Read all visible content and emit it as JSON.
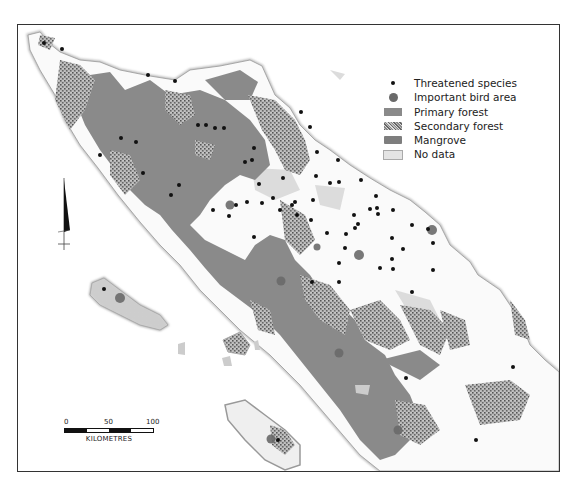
{
  "legend": {
    "items": [
      {
        "symbol": "dot",
        "label": "Threatened species",
        "color": "#111111"
      },
      {
        "symbol": "circle",
        "label": "Important bird area",
        "color": "#6a6a6a"
      },
      {
        "symbol": "swatch-solid",
        "label": "Primary forest",
        "color": "#8a8a8a"
      },
      {
        "symbol": "swatch-speckled",
        "label": "Secondary forest",
        "color": "#9a9a9a"
      },
      {
        "symbol": "swatch-solid-dark",
        "label": "Mangrove",
        "color": "#7e7e7e"
      },
      {
        "symbol": "swatch-light",
        "label": "No data",
        "color": "#dcdcdc"
      }
    ]
  },
  "scale_bar": {
    "ticks": [
      "0",
      "50",
      "100"
    ],
    "unit": "KILOMETRES"
  },
  "north_arrow": {
    "icon": "north-arrow-icon"
  },
  "colors": {
    "land": "#f4f4f4",
    "coast": "#bdbdbd",
    "primary_forest": "#8a8a8a",
    "secondary_forest": "#9c9c9c",
    "no_data": "#dcdcdc",
    "threatened_dot": "#111111",
    "bird_area": "#6a6a6a"
  },
  "threatened_species_points": [
    [
      44,
      43
    ],
    [
      62,
      49
    ],
    [
      148,
      75
    ],
    [
      175,
      83
    ],
    [
      224,
      129
    ],
    [
      198,
      125
    ],
    [
      206,
      127
    ],
    [
      214,
      128
    ],
    [
      121,
      138
    ],
    [
      179,
      185
    ],
    [
      143,
      173
    ],
    [
      252,
      160
    ],
    [
      301,
      114
    ],
    [
      310,
      129
    ],
    [
      245,
      162
    ],
    [
      259,
      167
    ],
    [
      247,
      206
    ],
    [
      213,
      210
    ],
    [
      236,
      215
    ],
    [
      262,
      203
    ],
    [
      295,
      203
    ],
    [
      295,
      213
    ],
    [
      338,
      159
    ],
    [
      316,
      176
    ],
    [
      283,
      177
    ],
    [
      315,
      152
    ],
    [
      341,
      181
    ],
    [
      358,
      224
    ],
    [
      346,
      235
    ],
    [
      339,
      263
    ],
    [
      354,
      215
    ],
    [
      307,
      151
    ],
    [
      339,
      194
    ],
    [
      361,
      180
    ],
    [
      330,
      180
    ],
    [
      376,
      195
    ],
    [
      378,
      208
    ],
    [
      377,
      214
    ],
    [
      407,
      211
    ],
    [
      355,
      228
    ],
    [
      327,
      236
    ],
    [
      297,
      181
    ],
    [
      288,
      208
    ],
    [
      345,
      248
    ],
    [
      273,
      198
    ],
    [
      370,
      208
    ],
    [
      392,
      211
    ],
    [
      412,
      225
    ],
    [
      413,
      241
    ],
    [
      422,
      268
    ],
    [
      412,
      290
    ],
    [
      423,
      213
    ],
    [
      391,
      237
    ],
    [
      404,
      248
    ],
    [
      368,
      274
    ],
    [
      349,
      293
    ],
    [
      312,
      282
    ],
    [
      294,
      232
    ],
    [
      290,
      236
    ],
    [
      433,
      239
    ],
    [
      460,
      277
    ],
    [
      513,
      367
    ],
    [
      406,
      378
    ],
    [
      105,
      290
    ],
    [
      280,
      241
    ],
    [
      136,
      142
    ],
    [
      171,
      195
    ],
    [
      100,
      155
    ],
    [
      259,
      184
    ],
    [
      301,
      158
    ],
    [
      313,
      201
    ],
    [
      254,
      237
    ]
  ],
  "important_bird_areas": [
    [
      230,
      205
    ],
    [
      359,
      255
    ],
    [
      432,
      230
    ],
    [
      120,
      298
    ],
    [
      281,
      281
    ],
    [
      339,
      353
    ],
    [
      271,
      439
    ],
    [
      398,
      430
    ],
    [
      317,
      247
    ]
  ]
}
